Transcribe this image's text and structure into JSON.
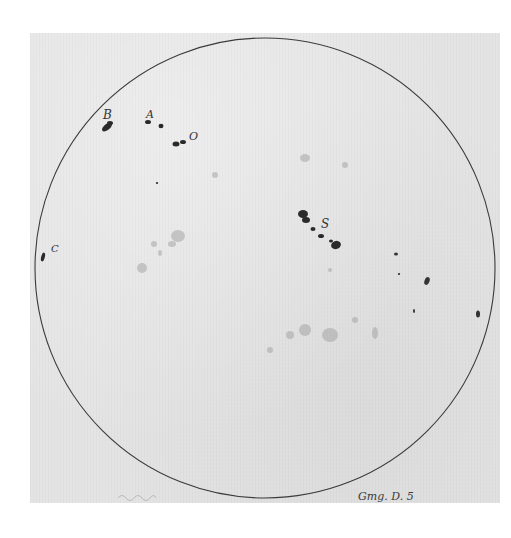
{
  "figure": {
    "disc": {
      "cx": 265,
      "cy": 268,
      "r": 230,
      "stroke": "#3a3a3a"
    },
    "paper_color": "#e4e4e4",
    "spot_color": "#2a2a2a",
    "labels": [
      {
        "id": "B",
        "text": "B",
        "x": 105,
        "y": 118
      },
      {
        "id": "A",
        "text": "A",
        "x": 147,
        "y": 117
      },
      {
        "id": "O",
        "text": "O",
        "x": 190,
        "y": 139
      },
      {
        "id": "S",
        "text": "S",
        "x": 322,
        "y": 226
      },
      {
        "id": "C",
        "text": "C",
        "x": 52,
        "y": 251
      }
    ],
    "signature": {
      "text": "Gmg. D. 5",
      "x": 358,
      "y": 500
    },
    "faint_signature": {
      "text": "",
      "x": 120,
      "y": 498
    }
  }
}
